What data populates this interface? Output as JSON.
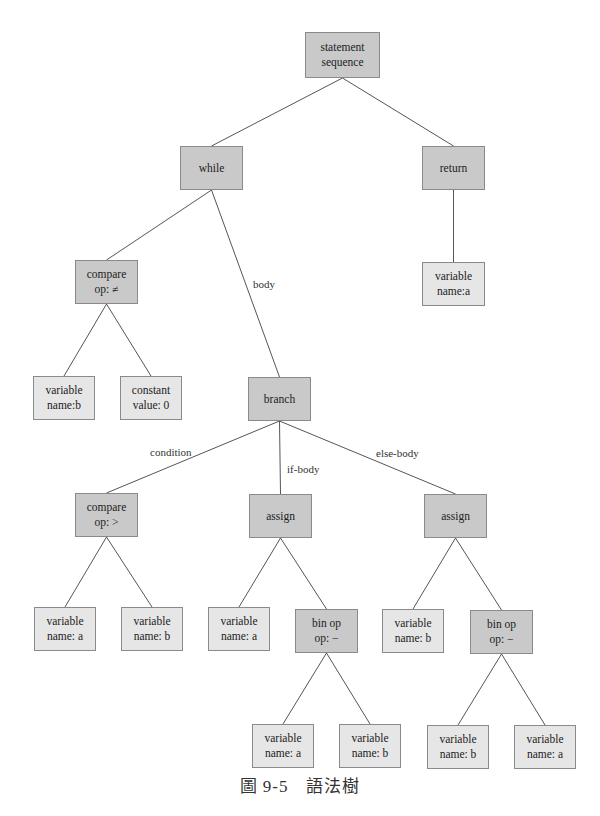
{
  "diagram": {
    "type": "syntax-tree",
    "caption": "圖 9-5　語法樹",
    "colors": {
      "internal_fill": "#c9c9c9",
      "leaf_fill": "#e6e6e6",
      "border": "#8a8a8a",
      "edge": "#555555"
    },
    "nodes": [
      {
        "id": "root",
        "lines": [
          "statement",
          "sequence"
        ],
        "kind": "dark",
        "x": 305,
        "y": 32,
        "w": 75,
        "h": 46
      },
      {
        "id": "while",
        "lines": [
          "while"
        ],
        "kind": "dark",
        "x": 180,
        "y": 146,
        "w": 63,
        "h": 44
      },
      {
        "id": "return",
        "lines": [
          "return"
        ],
        "kind": "dark",
        "x": 422,
        "y": 146,
        "w": 63,
        "h": 44
      },
      {
        "id": "cmp1",
        "lines": [
          "compare",
          "op: ≠"
        ],
        "kind": "dark",
        "x": 75,
        "y": 260,
        "w": 63,
        "h": 44
      },
      {
        "id": "ret_a",
        "lines": [
          "variable",
          "name:a"
        ],
        "kind": "light",
        "x": 422,
        "y": 262,
        "w": 63,
        "h": 44
      },
      {
        "id": "var_b",
        "lines": [
          "variable",
          "name:b"
        ],
        "kind": "light",
        "x": 33,
        "y": 376,
        "w": 62,
        "h": 44
      },
      {
        "id": "const0",
        "lines": [
          "constant",
          "value: 0"
        ],
        "kind": "light",
        "x": 120,
        "y": 376,
        "w": 62,
        "h": 44
      },
      {
        "id": "branch",
        "lines": [
          "branch"
        ],
        "kind": "dark",
        "x": 248,
        "y": 377,
        "w": 63,
        "h": 44
      },
      {
        "id": "cmp2",
        "lines": [
          "compare",
          "op: >"
        ],
        "kind": "dark",
        "x": 75,
        "y": 493,
        "w": 63,
        "h": 44
      },
      {
        "id": "assign1",
        "lines": [
          "assign"
        ],
        "kind": "dark",
        "x": 249,
        "y": 494,
        "w": 63,
        "h": 44
      },
      {
        "id": "assign2",
        "lines": [
          "assign"
        ],
        "kind": "dark",
        "x": 424,
        "y": 494,
        "w": 63,
        "h": 44
      },
      {
        "id": "c2_a",
        "lines": [
          "variable",
          "name: a"
        ],
        "kind": "light",
        "x": 34,
        "y": 607,
        "w": 62,
        "h": 44
      },
      {
        "id": "c2_b",
        "lines": [
          "variable",
          "name: b"
        ],
        "kind": "light",
        "x": 121,
        "y": 607,
        "w": 62,
        "h": 44
      },
      {
        "id": "as1_a",
        "lines": [
          "variable",
          "name: a"
        ],
        "kind": "light",
        "x": 208,
        "y": 607,
        "w": 62,
        "h": 44
      },
      {
        "id": "binop1",
        "lines": [
          "bin op",
          "op: −"
        ],
        "kind": "dark",
        "x": 295,
        "y": 609,
        "w": 63,
        "h": 44
      },
      {
        "id": "as2_b",
        "lines": [
          "variable",
          "name: b"
        ],
        "kind": "light",
        "x": 382,
        "y": 609,
        "w": 62,
        "h": 44
      },
      {
        "id": "binop2",
        "lines": [
          "bin op",
          "op: −"
        ],
        "kind": "dark",
        "x": 470,
        "y": 610,
        "w": 63,
        "h": 44
      },
      {
        "id": "b1_a",
        "lines": [
          "variable",
          "name: a"
        ],
        "kind": "light",
        "x": 252,
        "y": 724,
        "w": 62,
        "h": 44
      },
      {
        "id": "b1_b",
        "lines": [
          "variable",
          "name: b"
        ],
        "kind": "light",
        "x": 339,
        "y": 724,
        "w": 62,
        "h": 44
      },
      {
        "id": "b2_b",
        "lines": [
          "variable",
          "name: b"
        ],
        "kind": "light",
        "x": 427,
        "y": 725,
        "w": 62,
        "h": 44
      },
      {
        "id": "b2_a",
        "lines": [
          "variable",
          "name: a"
        ],
        "kind": "light",
        "x": 514,
        "y": 725,
        "w": 62,
        "h": 44
      }
    ],
    "edges": [
      {
        "from": "root",
        "to": "while"
      },
      {
        "from": "root",
        "to": "return"
      },
      {
        "from": "while",
        "to": "cmp1"
      },
      {
        "from": "while",
        "to": "branch",
        "label": "body"
      },
      {
        "from": "return",
        "to": "ret_a"
      },
      {
        "from": "cmp1",
        "to": "var_b"
      },
      {
        "from": "cmp1",
        "to": "const0"
      },
      {
        "from": "branch",
        "to": "cmp2",
        "label": "condition"
      },
      {
        "from": "branch",
        "to": "assign1",
        "label": "if-body"
      },
      {
        "from": "branch",
        "to": "assign2",
        "label": "else-body"
      },
      {
        "from": "cmp2",
        "to": "c2_a"
      },
      {
        "from": "cmp2",
        "to": "c2_b"
      },
      {
        "from": "assign1",
        "to": "as1_a"
      },
      {
        "from": "assign1",
        "to": "binop1"
      },
      {
        "from": "assign2",
        "to": "as2_b"
      },
      {
        "from": "assign2",
        "to": "binop2"
      },
      {
        "from": "binop1",
        "to": "b1_a"
      },
      {
        "from": "binop1",
        "to": "b1_b"
      },
      {
        "from": "binop2",
        "to": "b2_b"
      },
      {
        "from": "binop2",
        "to": "b2_a"
      }
    ],
    "edge_labels": [
      {
        "text": "body",
        "x": 253,
        "y": 278
      },
      {
        "text": "condition",
        "x": 150,
        "y": 446
      },
      {
        "text": "if-body",
        "x": 287,
        "y": 463
      },
      {
        "text": "else-body",
        "x": 376,
        "y": 447
      }
    ]
  }
}
